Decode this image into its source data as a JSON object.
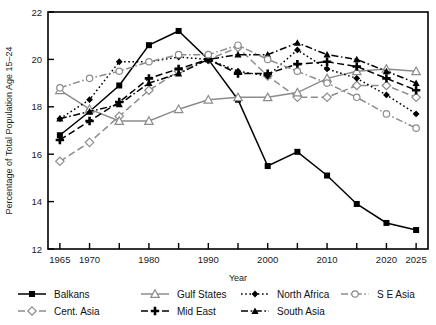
{
  "chart_data": {
    "type": "line",
    "title": "",
    "xlabel": "Year",
    "ylabel": "Percentage of Total Population Age 15–24",
    "x": [
      1965,
      1970,
      1975,
      1980,
      1985,
      1990,
      1995,
      2000,
      2005,
      2010,
      2015,
      2020,
      2025
    ],
    "xlim": [
      1963,
      2027
    ],
    "ylim": [
      12,
      22
    ],
    "xticks": [
      1965,
      1970,
      1975,
      1980,
      1985,
      1990,
      1995,
      2000,
      2005,
      2010,
      2015,
      2020,
      2025
    ],
    "xtick_labels": [
      "1965",
      "1970",
      "",
      "1980",
      "",
      "1990",
      "",
      "2000",
      "",
      "2010",
      "",
      "2020",
      "2025"
    ],
    "yticks": [
      12,
      14,
      16,
      18,
      20,
      22
    ],
    "ytick_labels": [
      "12",
      "14",
      "16",
      "18",
      "20",
      "22"
    ],
    "grid": false,
    "legend_position": "below",
    "series": [
      {
        "name": "Balkans",
        "color": "#000000",
        "line_style": "solid",
        "marker": "square-filled",
        "values": [
          16.8,
          17.8,
          18.9,
          20.6,
          21.2,
          20.0,
          18.3,
          15.5,
          16.1,
          15.1,
          13.9,
          13.1,
          12.8
        ]
      },
      {
        "name": "Cent. Asia",
        "color": "#8c8c8c",
        "line_style": "dashed",
        "marker": "diamond-open",
        "values": [
          15.7,
          16.5,
          17.6,
          18.7,
          19.5,
          20.0,
          20.5,
          19.3,
          18.4,
          18.4,
          18.9,
          18.9,
          18.4
        ]
      },
      {
        "name": "Gulf States",
        "color": "#8c8c8c",
        "line_style": "solid",
        "marker": "triangle-open",
        "values": [
          18.7,
          17.9,
          17.4,
          17.4,
          17.9,
          18.3,
          18.4,
          18.4,
          18.6,
          19.2,
          19.5,
          19.6,
          19.5
        ]
      },
      {
        "name": "Mid East",
        "color": "#000000",
        "line_style": "dashed",
        "marker": "plus-filled",
        "values": [
          16.6,
          17.4,
          18.2,
          19.2,
          19.6,
          20.0,
          19.4,
          19.4,
          19.8,
          19.9,
          19.7,
          19.2,
          18.7
        ]
      },
      {
        "name": "North Africa",
        "color": "#000000",
        "line_style": "dotted",
        "marker": "diamond-filled",
        "values": [
          17.5,
          18.3,
          19.9,
          19.9,
          20.1,
          20.0,
          19.5,
          19.3,
          20.4,
          19.6,
          19.2,
          18.5,
          17.7
        ]
      },
      {
        "name": "South Asia",
        "color": "#000000",
        "line_style": "dash-dot",
        "marker": "triangle-filled",
        "values": [
          17.5,
          17.8,
          18.1,
          19.0,
          19.4,
          20.0,
          20.2,
          20.2,
          20.7,
          20.2,
          20.0,
          19.5,
          19.0
        ]
      },
      {
        "name": "S E Asia",
        "color": "#8c8c8c",
        "line_style": "dash-dot",
        "marker": "circle-open",
        "values": [
          18.8,
          19.2,
          19.5,
          19.9,
          20.2,
          20.2,
          20.6,
          20.0,
          19.5,
          19.0,
          18.4,
          17.7,
          17.1
        ]
      }
    ]
  },
  "legend": {
    "items": [
      {
        "label": "Balkans"
      },
      {
        "label": "Gulf States"
      },
      {
        "label": "North Africa"
      },
      {
        "label": "S E Asia"
      },
      {
        "label": "Cent. Asia"
      },
      {
        "label": "Mid East"
      },
      {
        "label": "South Asia"
      }
    ]
  }
}
